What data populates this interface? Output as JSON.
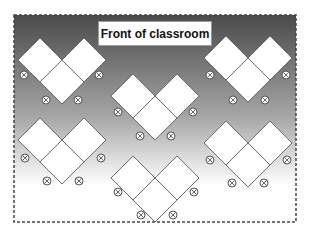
{
  "diagram": {
    "title": "Front of classroom",
    "colors": {
      "gradient_top": "#4a4a4a",
      "gradient_mid": "#a8a8a8",
      "gradient_bottom": "#ffffff",
      "table_fill": "#ffffff",
      "table_stroke": "#6a6a6a",
      "frame_border": "#444444",
      "seat_stroke": "#555555"
    },
    "frame": {
      "x": 14,
      "y": 15,
      "width": 282,
      "height": 207,
      "style": "dashed"
    },
    "table_half_diagonal": 22,
    "groups": [
      {
        "id": "group-1",
        "position": "top-left",
        "junction": [
          62,
          60
        ],
        "seats": [
          [
            24,
            75
          ],
          [
            99,
            75
          ],
          [
            46,
            100
          ],
          [
            78,
            100
          ]
        ]
      },
      {
        "id": "group-2",
        "position": "center-top",
        "junction": [
          155,
          96
        ],
        "seats": [
          [
            118,
            112
          ],
          [
            193,
            112
          ],
          [
            140,
            136
          ],
          [
            171,
            136
          ]
        ]
      },
      {
        "id": "group-3",
        "position": "top-right",
        "junction": [
          248,
          58
        ],
        "seats": [
          [
            210,
            75
          ],
          [
            286,
            75
          ],
          [
            233,
            100
          ],
          [
            265,
            100
          ]
        ]
      },
      {
        "id": "group-4",
        "position": "bottom-left",
        "junction": [
          62,
          140
        ],
        "seats": [
          [
            25,
            158
          ],
          [
            101,
            158
          ],
          [
            47,
            181
          ],
          [
            79,
            181
          ]
        ]
      },
      {
        "id": "group-5",
        "position": "bottom-right",
        "junction": [
          248,
          143
        ],
        "seats": [
          [
            210,
            160
          ],
          [
            287,
            160
          ],
          [
            232,
            183
          ],
          [
            264,
            183
          ]
        ]
      },
      {
        "id": "group-6",
        "position": "bottom-center",
        "junction": [
          155,
          178
        ],
        "seats": [
          [
            118,
            192
          ],
          [
            194,
            192
          ],
          [
            141,
            215
          ],
          [
            173,
            215
          ]
        ]
      }
    ],
    "seat_icon": "circled-x-icon"
  }
}
